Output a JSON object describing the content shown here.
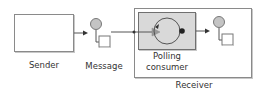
{
  "diagram": {
    "type": "enterprise-integration-pattern",
    "nodes": {
      "sender": {
        "label": "Sender"
      },
      "message": {
        "label": "Message"
      },
      "receiver": {
        "label": "Receiver"
      },
      "polling_consumer": {
        "label_line1": "Polling",
        "label_line2": "consumer"
      },
      "output_message": {
        "label": ""
      }
    },
    "edges": [
      {
        "from": "sender",
        "to": "message"
      },
      {
        "from": "message",
        "to": "polling_consumer"
      },
      {
        "from": "polling_consumer",
        "to": "output_message"
      }
    ],
    "colors": {
      "border": "#8a8a8a",
      "consumer_fill": "#d9d9d9",
      "message_circle": "#c4c4c4",
      "arrow": "#333333"
    }
  }
}
